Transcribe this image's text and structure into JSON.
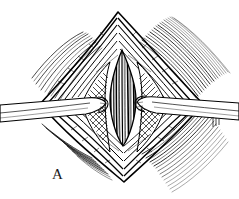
{
  "figure": {
    "panel_label": "A",
    "label_position": {
      "x": 52,
      "y": 166
    },
    "canvas": {
      "width": 239,
      "height": 199
    },
    "colors": {
      "ink": "#000000",
      "background": "#ffffff",
      "shadow": "#1a1a1a",
      "midtone": "#555555",
      "hatch": "#2b2b2b"
    },
    "geometry": {
      "diamond": {
        "top_apex": {
          "x": 118,
          "y": 12
        },
        "bottom_apex": {
          "x": 124,
          "y": 182
        },
        "left_vertex": {
          "x": 40,
          "y": 104
        },
        "right_vertex": {
          "x": 203,
          "y": 104
        }
      },
      "central_lens": {
        "top": {
          "x": 122,
          "y": 50
        },
        "bottom": {
          "x": 123,
          "y": 146
        },
        "left": {
          "x": 110,
          "y": 98
        },
        "right": {
          "x": 136,
          "y": 98
        },
        "striation_count": 11
      },
      "left_retractor": {
        "entry": {
          "x": 0,
          "y": 112
        },
        "tip": {
          "x": 104,
          "y": 100
        }
      },
      "right_retractor": {
        "entry": {
          "x": 239,
          "y": 110
        },
        "tip": {
          "x": 140,
          "y": 104
        }
      }
    },
    "parts": [
      {
        "name": "top-apex-bands",
        "label": "nested tissue edge bands, superior"
      },
      {
        "name": "bottom-apex-bands",
        "label": "nested tissue edge bands, inferior"
      },
      {
        "name": "central-muscle",
        "label": "striated muscle fibers"
      },
      {
        "name": "shadow-left",
        "label": "cross hatched wound shadow, left"
      },
      {
        "name": "shadow-right",
        "label": "cross hatched wound shadow, right"
      },
      {
        "name": "retractor-left",
        "label": "retractor blade, left"
      },
      {
        "name": "retractor-right",
        "label": "retractor blade, right"
      },
      {
        "name": "radiating-hatch",
        "label": "radiating skin tension lines"
      }
    ]
  }
}
